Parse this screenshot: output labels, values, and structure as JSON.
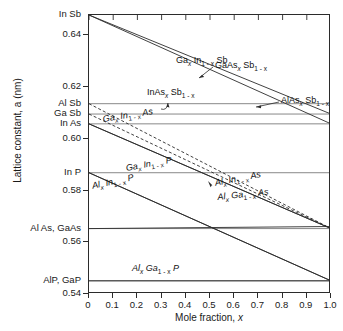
{
  "chart_data": {
    "type": "line",
    "title": "",
    "xlabel": "Mole fraction, x",
    "ylabel": "Lattice constant, a (nm)",
    "xlim": [
      0,
      1.0
    ],
    "ylim": [
      0.54,
      0.6479
    ],
    "grid": "horizontal-reference-lines-at-binary-compounds",
    "legend": "inline-curve-labels",
    "x_ticks": [
      "0",
      "0.1",
      "0.2",
      "0.3",
      "0.4",
      "0.5",
      "0.6",
      "0.7",
      "0.8",
      "0.9",
      "1.0"
    ],
    "x_tick_values": [
      0,
      0.1,
      0.2,
      0.3,
      0.4,
      0.5,
      0.6,
      0.7,
      0.8,
      0.9,
      1.0
    ],
    "y_numeric_ticks": [
      "0.64",
      "0.62",
      "0.60",
      "0.58",
      "0.56",
      "0.54"
    ],
    "y_numeric_tick_values": [
      0.64,
      0.62,
      0.6,
      0.58,
      0.56,
      0.54
    ],
    "y_compound_ticks": [
      {
        "label": "In Sb",
        "value": 0.6479
      },
      {
        "label": "Al Sb",
        "value": 0.6136
      },
      {
        "label": "Ga Sb",
        "value": 0.6096
      },
      {
        "label": "In As",
        "value": 0.6058
      },
      {
        "label": "In P",
        "value": 0.5869
      },
      {
        "label": "Al As, GaAs",
        "value": 0.5653
      },
      {
        "label": "AlP, GaP",
        "value": 0.5451
      }
    ],
    "reference_lines": [
      0.6136,
      0.6096,
      0.6058,
      0.5869,
      0.5653,
      0.5451
    ],
    "series": [
      {
        "name": "Ga_x In_1-x Sb",
        "label_html": "Ga<sub>x</sub> In<sub>1 - x</sub> Sb",
        "style": "solid",
        "x": [
          0,
          1.0
        ],
        "y": [
          0.6479,
          0.6096
        ]
      },
      {
        "name": "InAs_x Sb_1-x",
        "label_html": "InAs<sub>x</sub> Sb<sub>1 - x</sub>",
        "style": "solid",
        "x": [
          0,
          1.0
        ],
        "y": [
          0.6479,
          0.6058
        ]
      },
      {
        "name": "GaAs_x Sb_1-x",
        "label_html": "GaAs<sub>x</sub> Sb<sub>1 - x</sub>",
        "style": "dashed",
        "x": [
          0,
          1.0
        ],
        "y": [
          0.6096,
          0.5653
        ]
      },
      {
        "name": "AlAs_x Sb_1-x",
        "label_html": "AlAs<sub>x</sub> Sb<sub>1 - x</sub>",
        "style": "dashed",
        "x": [
          0,
          1.0
        ],
        "y": [
          0.6136,
          0.5653
        ]
      },
      {
        "name": "Ga_x In_1-x As",
        "label_html": "Ga<sub>x</sub> In<sub>1 - x</sub> As",
        "style": "solid",
        "x": [
          0,
          1.0
        ],
        "y": [
          0.6058,
          0.5653
        ]
      },
      {
        "name": "Al_x In_1-x As",
        "label_html": "Al<sub>x</sub> In<sub>1 - x</sub> As",
        "style": "solid",
        "x": [
          0,
          1.0
        ],
        "y": [
          0.6058,
          0.5653
        ]
      },
      {
        "name": "Ga_x In_1-x P",
        "label_html": "Ga<sub>x</sub> In<sub>1 - x</sub> P",
        "style": "solid",
        "x": [
          0,
          1.0
        ],
        "y": [
          0.5869,
          0.5451
        ]
      },
      {
        "name": "Al_x In_1-x P",
        "label_html": "Al<sub>x</sub> In<sub>1 - x</sub> P",
        "style": "solid",
        "x": [
          0,
          1.0
        ],
        "y": [
          0.5869,
          0.5451
        ]
      },
      {
        "name": "Al_x Ga_1-x As",
        "label_html": "Al<sub>x</sub> Ga<sub>1 - x</sub> As",
        "style": "solid",
        "x": [
          0,
          1.0
        ],
        "y": [
          0.5653,
          0.5661
        ]
      },
      {
        "name": "Al_x Ga_1-x P",
        "label_html": "Al<sub>x</sub> Ga<sub>1 - x</sub> P",
        "style": "solid",
        "x": [
          0,
          1.0
        ],
        "y": [
          0.5451,
          0.5451
        ]
      }
    ],
    "annotations": [
      {
        "text": "GaAs_x Sb_1-x",
        "type": "leader-arrow",
        "points_to": "dashed upper band"
      },
      {
        "text": "AlAs_x Sb_1-x",
        "type": "leader-arrow",
        "points_to": "dashed lower band"
      },
      {
        "text": "Ga_x In_1-x As",
        "type": "leader-arrow",
        "points_to": "solid line to GaAs"
      },
      {
        "text": "Al_x Ga_1-x As",
        "type": "leader-arrow",
        "points_to": "nearly horizontal AlGaAs line"
      }
    ]
  },
  "axes": {
    "y_title": "Lattice constant, a (nm)",
    "x_title_main": "Mole fraction, ",
    "x_title_italic": "x"
  },
  "curve_labels": {
    "gainsb": {
      "pre": "Ga",
      "sub1": "x",
      "mid": " In",
      "sub2": "1 - x",
      "post": " Sb"
    },
    "inassb": {
      "pre": "InAs",
      "sub1": "x",
      "mid": " Sb",
      "sub2": "1 - x",
      "post": ""
    },
    "gaassb": {
      "pre": "GaAs",
      "sub1": "x",
      "mid": " Sb",
      "sub2": "1 - x",
      "post": ""
    },
    "alassb": {
      "pre": "AlAs",
      "sub1": "x",
      "mid": " Sb",
      "sub2": "1 - x",
      "post": ""
    },
    "gainas": {
      "pre": "Ga",
      "sub1": "x",
      "mid": " In",
      "sub2": "1 - x",
      "post": " As"
    },
    "alinas": {
      "pre": "Al",
      "sub1": "x",
      "mid": " In",
      "sub2": "1 - x",
      "post": " As"
    },
    "gainp": {
      "pre": "Ga",
      "sub1": "x",
      "mid": " In",
      "sub2": "1 - x",
      "post": " P"
    },
    "alinp": {
      "pre": "Al",
      "sub1": "x",
      "mid": " In",
      "sub2": "1 - x",
      "post": " P"
    },
    "algaas": {
      "pre": "Al",
      "sub1": "x",
      "mid": " Ga",
      "sub2": "1 - x",
      "post": " As"
    },
    "algap": {
      "pre": "Al",
      "sub1": "x",
      "mid": " Ga",
      "sub2": "1 - x",
      "post": " P"
    }
  },
  "colors": {
    "line": "#2b2b2b",
    "reference_line": "#7a7a7a",
    "background": "#ffffff",
    "text": "#1a1a1a"
  }
}
